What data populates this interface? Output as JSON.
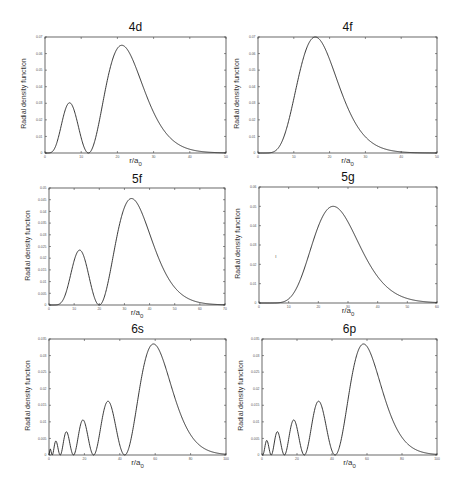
{
  "figure": {
    "ylabel": "Radial density function",
    "xlabel_main": "r/a",
    "xlabel_sub": "0"
  },
  "chart_data": [
    {
      "type": "line",
      "title": "4d",
      "xlabel": "r/a0",
      "ylabel": "Radial density function",
      "xlim": [
        0,
        50
      ],
      "ylim": [
        0,
        0.07
      ],
      "xticks": [
        0,
        10,
        20,
        30,
        40,
        50
      ],
      "yticks": [
        0,
        0.01,
        0.02,
        0.03,
        0.04,
        0.05,
        0.06,
        0.07
      ],
      "grid": false,
      "n": 4,
      "l": 2,
      "features": {
        "peaks": [
          {
            "r": 6.5,
            "value": 0.03
          },
          {
            "r": 21.2,
            "value": 0.065
          }
        ],
        "nodes": [
          12
        ]
      }
    },
    {
      "type": "line",
      "title": "4f",
      "xlabel": "r/a0",
      "ylabel": "Radial density function",
      "xlim": [
        0,
        50
      ],
      "ylim": [
        0,
        0.07
      ],
      "xticks": [
        0,
        10,
        20,
        30,
        40,
        50
      ],
      "yticks": [
        0,
        0.01,
        0.02,
        0.03,
        0.04,
        0.05,
        0.06,
        0.07
      ],
      "grid": false,
      "n": 4,
      "l": 3,
      "features": {
        "peaks": [
          {
            "r": 16,
            "value": 0.07
          }
        ],
        "nodes": []
      }
    },
    {
      "type": "line",
      "title": "5f",
      "xlabel": "r/a0",
      "ylabel": "Radial density function",
      "xlim": [
        0,
        70
      ],
      "ylim": [
        0,
        0.05
      ],
      "xticks": [
        0,
        10,
        20,
        30,
        40,
        50,
        60,
        70
      ],
      "yticks": [
        0,
        0.005,
        0.01,
        0.015,
        0.02,
        0.025,
        0.03,
        0.035,
        0.04,
        0.045,
        0.05
      ],
      "grid": false,
      "n": 5,
      "l": 3,
      "features": {
        "peaks": [
          {
            "r": 12,
            "value": 0.0235
          },
          {
            "r": 33,
            "value": 0.0455
          }
        ],
        "nodes": [
          20
        ]
      }
    },
    {
      "type": "line",
      "title": "5g",
      "xlabel": "r/a0",
      "ylabel": "Radial density function",
      "xlim": [
        0,
        60
      ],
      "ylim": [
        0,
        0.06
      ],
      "xticks": [
        0,
        10,
        20,
        30,
        40,
        50,
        60
      ],
      "yticks": [
        0,
        0.01,
        0.02,
        0.03,
        0.04,
        0.05,
        0.06
      ],
      "grid": false,
      "n": 5,
      "l": 4,
      "features": {
        "peaks": [
          {
            "r": 25,
            "value": 0.05
          }
        ],
        "nodes": []
      }
    },
    {
      "type": "line",
      "title": "6s",
      "xlabel": "r/a0",
      "ylabel": "Radial density function",
      "xlim": [
        0,
        100
      ],
      "ylim": [
        0,
        0.035
      ],
      "xticks": [
        0,
        20,
        40,
        60,
        80,
        100
      ],
      "yticks": [
        0,
        0.005,
        0.01,
        0.015,
        0.02,
        0.025,
        0.03,
        0.035
      ],
      "grid": false,
      "n": 6,
      "l": 0,
      "features": {
        "peaks": [
          {
            "r": 0.8,
            "value": 0.002
          },
          {
            "r": 4,
            "value": 0.0045
          },
          {
            "r": 10,
            "value": 0.007
          },
          {
            "r": 19,
            "value": 0.0105
          },
          {
            "r": 33,
            "value": 0.0165
          },
          {
            "r": 59,
            "value": 0.0335
          }
        ],
        "nodes": [
          2,
          6.5,
          14,
          25,
          42
        ]
      }
    },
    {
      "type": "line",
      "title": "6p",
      "xlabel": "r/a0",
      "ylabel": "Radial density function",
      "xlim": [
        0,
        100
      ],
      "ylim": [
        0,
        0.035
      ],
      "xticks": [
        0,
        20,
        40,
        60,
        80,
        100
      ],
      "yticks": [
        0,
        0.005,
        0.01,
        0.015,
        0.02,
        0.025,
        0.03,
        0.035
      ],
      "grid": false,
      "n": 6,
      "l": 1,
      "features": {
        "peaks": [
          {
            "r": 3,
            "value": 0.0045
          },
          {
            "r": 8.5,
            "value": 0.007
          },
          {
            "r": 18,
            "value": 0.011
          },
          {
            "r": 32,
            "value": 0.0165
          },
          {
            "r": 58,
            "value": 0.0335
          }
        ],
        "nodes": [
          5,
          12.5,
          24,
          41
        ]
      }
    }
  ],
  "layout": {
    "panels": [
      {
        "box": [
          45,
          37,
          181,
          116
        ],
        "title_y": 20
      },
      {
        "box": [
          258,
          37,
          179,
          116
        ],
        "title_y": 20
      },
      {
        "box": [
          49,
          188,
          176,
          117
        ],
        "title_y": 172
      },
      {
        "box": [
          259,
          187,
          178,
          116
        ],
        "title_y": 170
      },
      {
        "box": [
          49,
          339,
          177,
          116
        ],
        "title_y": 322
      },
      {
        "box": [
          262,
          339,
          175,
          116
        ],
        "title_y": 322
      }
    ],
    "stray_mark": {
      "x": 275,
      "y": 253,
      "text": "ı"
    }
  }
}
